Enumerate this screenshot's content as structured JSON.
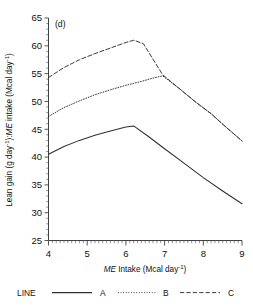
{
  "figure": {
    "panel_label": "(d)",
    "background": "#ffffff",
    "ink_color": "#2f2f35"
  },
  "axes": {
    "x_title_italic": "ME",
    "x_title_rest": " Intake  (Mcal day",
    "x_title_sup": "-1",
    "x_title_tail": ")",
    "x_title_plain": "ME Intake (Mcal day-1)",
    "y_title_part1": "Lean gain (g day",
    "y_title_sup1": "-1",
    "y_title_mid": "):",
    "y_title_italic": "ME",
    "y_title_part2": " intake (Mcal day",
    "y_title_sup2": "-1",
    "y_title_tail": ")",
    "y_title_plain": "Lean gain (g day-1):ME intake (Mcal day-1)",
    "x_ticks": [
      "4",
      "5",
      "6",
      "7",
      "8",
      "9"
    ],
    "y_ticks": [
      "65",
      "60",
      "55",
      "50",
      "45",
      "40",
      "35",
      "30",
      "25"
    ]
  },
  "legend": {
    "title": "LINE",
    "entries": [
      {
        "label": "A",
        "style": "solid"
      },
      {
        "label": "B",
        "style": "dotted"
      },
      {
        "label": "C",
        "style": "dashed"
      }
    ]
  },
  "chart_data": {
    "type": "line",
    "title": "(d)",
    "xlabel": "ME Intake (Mcal day-1)",
    "ylabel": "Lean gain (g day-1):ME intake (Mcal day-1)",
    "xlim": [
      4,
      9
    ],
    "ylim": [
      25,
      65
    ],
    "x_ticks": [
      4,
      5,
      6,
      7,
      8,
      9
    ],
    "y_ticks": [
      25,
      30,
      35,
      40,
      45,
      50,
      55,
      60,
      65
    ],
    "grid": false,
    "legend_position": "below-plot",
    "legend_title": "LINE",
    "series": [
      {
        "name": "A",
        "style": "solid",
        "breakpoint_x": 6.2,
        "breakpoint_y": 45.6,
        "points": [
          {
            "x": 4.0,
            "y": 40.5
          },
          {
            "x": 4.4,
            "y": 41.9
          },
          {
            "x": 4.8,
            "y": 43.0
          },
          {
            "x": 5.2,
            "y": 43.9
          },
          {
            "x": 5.6,
            "y": 44.7
          },
          {
            "x": 6.0,
            "y": 45.4
          },
          {
            "x": 6.2,
            "y": 45.6
          },
          {
            "x": 6.6,
            "y": 43.6
          },
          {
            "x": 7.0,
            "y": 41.5
          },
          {
            "x": 7.5,
            "y": 38.9
          },
          {
            "x": 8.0,
            "y": 36.3
          },
          {
            "x": 8.5,
            "y": 33.9
          },
          {
            "x": 9.0,
            "y": 31.6
          }
        ]
      },
      {
        "name": "B",
        "style": "dotted",
        "breakpoint_x": 6.95,
        "breakpoint_y": 54.6,
        "points": [
          {
            "x": 4.0,
            "y": 47.3
          },
          {
            "x": 4.4,
            "y": 48.9
          },
          {
            "x": 4.8,
            "y": 50.1
          },
          {
            "x": 5.2,
            "y": 51.2
          },
          {
            "x": 5.6,
            "y": 52.1
          },
          {
            "x": 6.0,
            "y": 52.9
          },
          {
            "x": 6.4,
            "y": 53.6
          },
          {
            "x": 6.7,
            "y": 54.2
          },
          {
            "x": 6.95,
            "y": 54.6
          },
          {
            "x": 7.4,
            "y": 52.2
          },
          {
            "x": 7.8,
            "y": 49.9
          },
          {
            "x": 8.2,
            "y": 47.8
          },
          {
            "x": 8.6,
            "y": 45.3
          },
          {
            "x": 9.0,
            "y": 42.9
          }
        ]
      },
      {
        "name": "C",
        "style": "dashed",
        "breakpoint_x": 6.2,
        "breakpoint_y": 61.0,
        "points": [
          {
            "x": 4.0,
            "y": 54.3
          },
          {
            "x": 4.4,
            "y": 56.1
          },
          {
            "x": 4.8,
            "y": 57.5
          },
          {
            "x": 5.2,
            "y": 58.6
          },
          {
            "x": 5.6,
            "y": 59.6
          },
          {
            "x": 6.0,
            "y": 60.6
          },
          {
            "x": 6.2,
            "y": 61.0
          },
          {
            "x": 6.45,
            "y": 60.4
          },
          {
            "x": 6.95,
            "y": 54.8
          },
          {
            "x": 7.4,
            "y": 52.2
          },
          {
            "x": 7.8,
            "y": 49.9
          },
          {
            "x": 8.2,
            "y": 47.8
          },
          {
            "x": 8.6,
            "y": 45.3
          },
          {
            "x": 9.0,
            "y": 42.9
          }
        ]
      }
    ]
  }
}
